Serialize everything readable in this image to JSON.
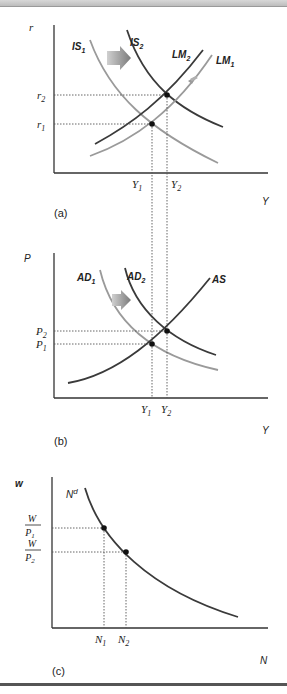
{
  "figure": {
    "panels": [
      {
        "id": "a",
        "label": "(a)",
        "y_axis_label": "r",
        "x_axis_label": "Y",
        "curves": [
          {
            "name": "IS1",
            "base": "IS",
            "sub": "1",
            "color": "#9a9a9a"
          },
          {
            "name": "IS2",
            "base": "IS",
            "sub": "2",
            "color": "#3a3a3a"
          },
          {
            "name": "LM2",
            "base": "LM",
            "sub": "2",
            "color": "#3a3a3a"
          },
          {
            "name": "LM1",
            "base": "LM",
            "sub": "1",
            "color": "#9a9a9a"
          }
        ],
        "y_ticks": [
          {
            "base": "r",
            "sub": "2"
          },
          {
            "base": "r",
            "sub": "1"
          }
        ],
        "x_ticks": [
          {
            "base": "Y",
            "sub": "1"
          },
          {
            "base": "Y",
            "sub": "2"
          }
        ],
        "arrows": [
          "IS shifts right",
          "LM shifts left"
        ]
      },
      {
        "id": "b",
        "label": "(b)",
        "y_axis_label": "P",
        "x_axis_label": "Y",
        "curves": [
          {
            "name": "AD1",
            "base": "AD",
            "sub": "1",
            "color": "#9a9a9a"
          },
          {
            "name": "AD2",
            "base": "AD",
            "sub": "2",
            "color": "#3a3a3a"
          },
          {
            "name": "AS",
            "base": "AS",
            "sub": "",
            "color": "#3a3a3a"
          }
        ],
        "y_ticks": [
          {
            "base": "P",
            "sub": "2"
          },
          {
            "base": "P",
            "sub": "1"
          }
        ],
        "x_ticks": [
          {
            "base": "Y",
            "sub": "1"
          },
          {
            "base": "Y",
            "sub": "2"
          }
        ],
        "arrows": [
          "AD shifts right"
        ]
      },
      {
        "id": "c",
        "label": "(c)",
        "y_axis_label": "w",
        "x_axis_label": "N",
        "curves": [
          {
            "name": "Nd",
            "base": "N",
            "sup": "d",
            "color": "#3a3a3a"
          }
        ],
        "y_ticks": [
          {
            "num": "W",
            "den_base": "P",
            "den_sub": "1"
          },
          {
            "num": "W",
            "den_base": "P",
            "den_sub": "2"
          }
        ],
        "x_ticks": [
          {
            "base": "N",
            "sub": "1"
          },
          {
            "base": "N",
            "sub": "2"
          }
        ]
      }
    ],
    "colors": {
      "dark_curve": "#3a3a3a",
      "light_curve": "#9a9a9a",
      "axis": "#333333",
      "arrow": "#8c8c8c"
    }
  }
}
